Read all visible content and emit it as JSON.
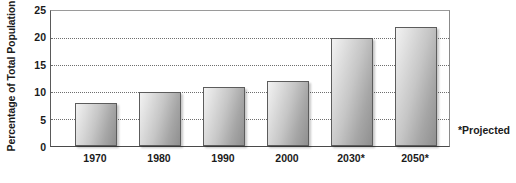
{
  "chart_data": {
    "type": "bar",
    "title": "",
    "xlabel": "",
    "ylabel": "Percentage of Total Population",
    "categories": [
      "1970",
      "1980",
      "1990",
      "2000",
      "2030*",
      "2050*"
    ],
    "values": [
      8,
      10,
      11,
      12,
      20,
      22
    ],
    "ylim": [
      0,
      25
    ],
    "yticks": [
      0,
      5,
      10,
      15,
      20,
      25
    ],
    "ytick_labels": [
      "0",
      "5",
      "10",
      "15",
      "20",
      "25"
    ],
    "gridlines": [
      5,
      10,
      15,
      20
    ],
    "grid": true,
    "grid_style": "dotted",
    "legend": null,
    "legend_position": "none",
    "annotations": [
      {
        "name": "projected-footnote",
        "text": "*Projected"
      }
    ],
    "bar_style": {
      "fill_light": "#f2f2f2",
      "fill_dark": "#8f8f8f",
      "border": "#5c5c5c"
    },
    "axis_color": "#5a5a5a",
    "text_color": "#1b1b1b"
  }
}
